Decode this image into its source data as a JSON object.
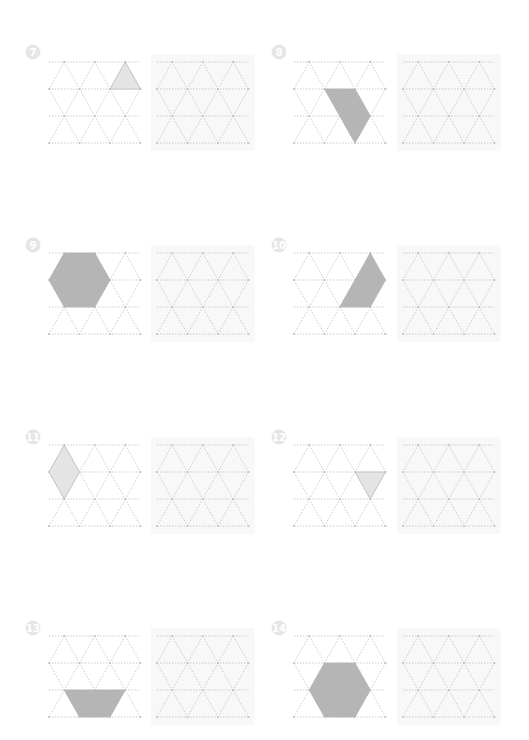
{
  "page": {
    "background": "#ffffff",
    "colors": {
      "dark_fill": "#b5b5b5",
      "light_fill": "#e4e4e4",
      "light_stroke": "#bdbdbd",
      "grid": "#b9b9b9",
      "badge": "#e6e6e6"
    }
  },
  "lattice": {
    "spacing": 30.5,
    "row_height": 27,
    "rows": 4,
    "note_layout": "rows 0 and 2 have 3 points offset by half spacing; rows 1 and 3 have 4 points"
  },
  "problems": [
    {
      "number": "7",
      "badge": {
        "x": 33,
        "y": 52
      },
      "original_grid": {
        "x0": 49,
        "top": 62
      },
      "copy_grid": {
        "x0": 157,
        "top": 62
      },
      "shape": {
        "name": "triangle",
        "fill": "light",
        "vertices": [
          [
            0,
            2
          ],
          [
            1,
            2
          ],
          [
            1,
            3
          ]
        ]
      }
    },
    {
      "number": "8",
      "badge": {
        "x": 279,
        "y": 52
      },
      "original_grid": {
        "x0": 294,
        "top": 62
      },
      "copy_grid": {
        "x0": 403,
        "top": 62
      },
      "shape": {
        "name": "parallelogram",
        "fill": "dark",
        "vertices": [
          [
            1,
            1
          ],
          [
            1,
            2
          ],
          [
            2,
            2
          ],
          [
            3,
            2
          ]
        ]
      }
    },
    {
      "number": "9",
      "badge": {
        "x": 33,
        "y": 245
      },
      "original_grid": {
        "x0": 49,
        "top": 253
      },
      "copy_grid": {
        "x0": 157,
        "top": 253
      },
      "shape": {
        "name": "hexagon",
        "fill": "dark",
        "vertices": [
          [
            0,
            0
          ],
          [
            0,
            1
          ],
          [
            1,
            2
          ],
          [
            2,
            1
          ],
          [
            2,
            0
          ],
          [
            1,
            0
          ]
        ]
      }
    },
    {
      "number": "10",
      "badge": {
        "x": 279,
        "y": 245
      },
      "original_grid": {
        "x0": 294,
        "top": 253
      },
      "copy_grid": {
        "x0": 403,
        "top": 253
      },
      "shape": {
        "name": "parallelogram",
        "fill": "dark",
        "vertices": [
          [
            0,
            2
          ],
          [
            1,
            3
          ],
          [
            2,
            2
          ],
          [
            2,
            1
          ],
          [
            1,
            2
          ]
        ]
      }
    },
    {
      "number": "11",
      "badge": {
        "x": 33,
        "y": 437
      },
      "original_grid": {
        "x0": 49,
        "top": 445
      },
      "copy_grid": {
        "x0": 157,
        "top": 445
      },
      "shape": {
        "name": "rhombus",
        "fill": "light",
        "vertices": [
          [
            0,
            0
          ],
          [
            1,
            1
          ],
          [
            2,
            0
          ],
          [
            1,
            0
          ]
        ]
      }
    },
    {
      "number": "12",
      "badge": {
        "x": 279,
        "y": 437
      },
      "original_grid": {
        "x0": 294,
        "top": 445
      },
      "copy_grid": {
        "x0": 403,
        "top": 445
      },
      "shape": {
        "name": "inverted-triangle",
        "fill": "light",
        "vertices": [
          [
            1,
            2
          ],
          [
            1,
            3
          ],
          [
            2,
            2
          ]
        ]
      }
    },
    {
      "number": "13",
      "badge": {
        "x": 33,
        "y": 628
      },
      "original_grid": {
        "x0": 49,
        "top": 636
      },
      "copy_grid": {
        "x0": 157,
        "top": 636
      },
      "shape": {
        "name": "trapezoid",
        "fill": "dark",
        "vertices": [
          [
            2,
            0
          ],
          [
            2,
            2
          ],
          [
            3,
            2
          ],
          [
            3,
            1
          ]
        ]
      }
    },
    {
      "number": "14",
      "badge": {
        "x": 279,
        "y": 628
      },
      "original_grid": {
        "x0": 294,
        "top": 636
      },
      "copy_grid": {
        "x0": 403,
        "top": 636
      },
      "shape": {
        "name": "hexagon",
        "fill": "dark",
        "vertices": [
          [
            1,
            1
          ],
          [
            1,
            2
          ],
          [
            2,
            2
          ],
          [
            3,
            2
          ],
          [
            3,
            1
          ],
          [
            2,
            0
          ]
        ]
      }
    }
  ]
}
